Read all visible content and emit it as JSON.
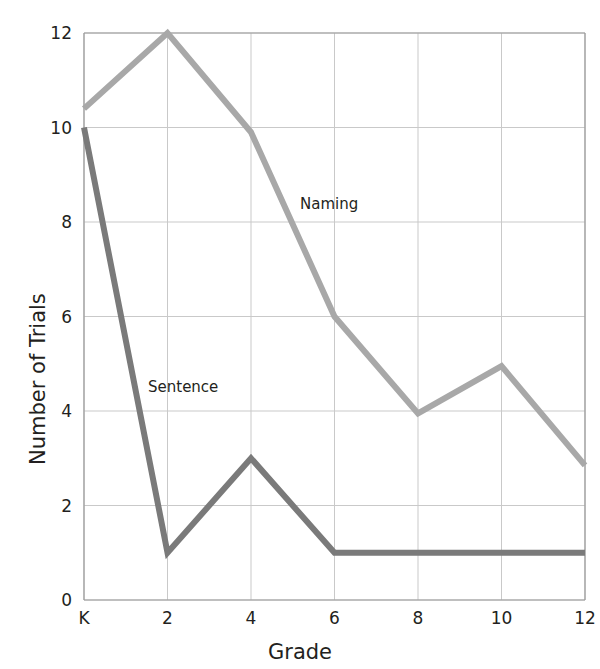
{
  "chart_data": {
    "type": "line",
    "title": "",
    "xlabel": "Grade",
    "ylabel": "Number of Trials",
    "x": [
      "K",
      "2",
      "4",
      "6",
      "8",
      "10",
      "12"
    ],
    "x_tick_labels": [
      "K",
      "2",
      "4",
      "6",
      "8",
      "10",
      "12"
    ],
    "y_tick_labels": [
      "0",
      "2",
      "4",
      "6",
      "8",
      "10",
      "12"
    ],
    "xlim": [
      0,
      6
    ],
    "ylim": [
      0,
      12
    ],
    "grid": true,
    "legend_position": "inline-annotation",
    "series": [
      {
        "name": "Naming",
        "color": "#a8a8a8",
        "values": [
          10.4,
          12,
          9.9,
          6.0,
          3.95,
          4.95,
          2.85
        ],
        "label_x": "4",
        "label_position": {
          "x": 300,
          "y": 195
        }
      },
      {
        "name": "Sentence",
        "color": "#7a7a7a",
        "values": [
          10,
          1,
          3,
          1,
          1,
          1,
          1
        ],
        "label_x": "2",
        "label_position": {
          "x": 148,
          "y": 378
        }
      }
    ]
  },
  "annotations": {
    "naming_label": "Naming",
    "sentence_label": "Sentence"
  },
  "axes": {
    "x_title": "Grade",
    "y_title": "Number of Trials"
  },
  "colors": {
    "naming": "#a8a8a8",
    "sentence": "#7a7a7a",
    "grid": "#c9c9c9",
    "axis": "#9a9a9a",
    "text": "#231f20",
    "background": "#ffffff"
  },
  "geometry": {
    "plot_left": 84,
    "plot_right": 585,
    "plot_top": 33,
    "plot_bottom": 600
  }
}
